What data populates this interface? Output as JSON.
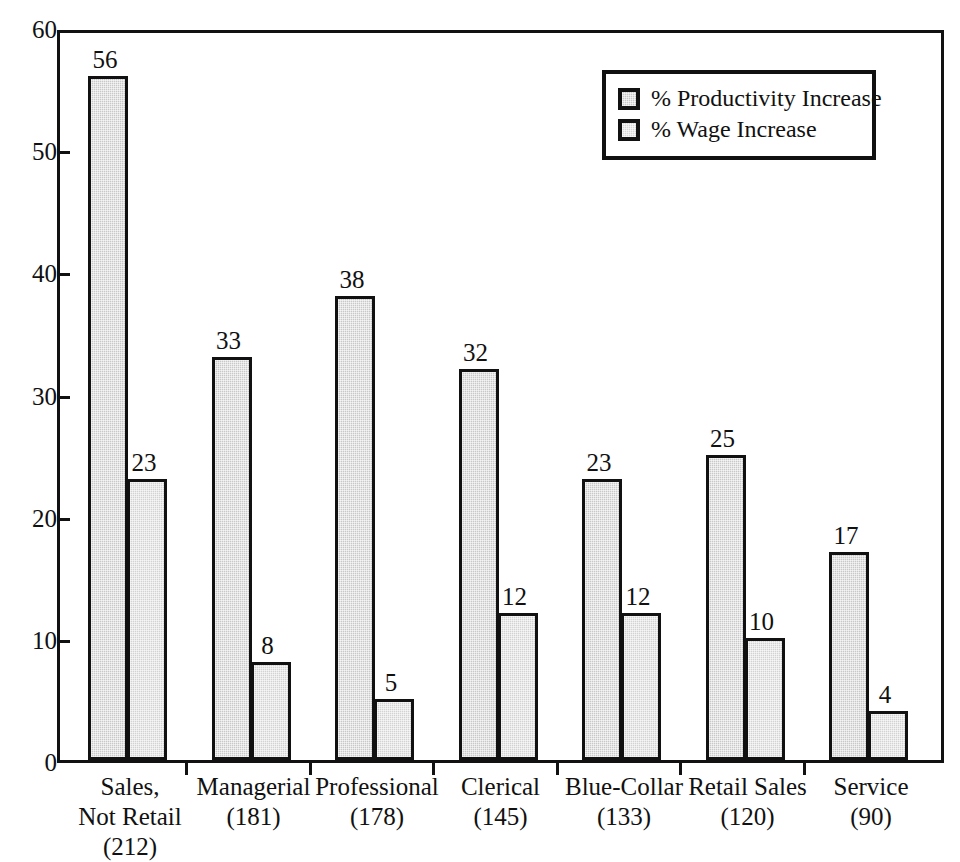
{
  "chart_data": {
    "type": "bar",
    "title": "",
    "subtitle": "",
    "xlabel": "",
    "ylabel": "",
    "ylim": [
      0,
      60
    ],
    "y_ticks": [
      0,
      10,
      20,
      30,
      40,
      50,
      60
    ],
    "y_tick_labels": [
      "0",
      "10",
      "20",
      "30",
      "40",
      "50",
      "60"
    ],
    "grid": false,
    "legend_position": "top-right",
    "categories": [
      "Sales,\nNot Retail\n(212)",
      "Managerial\n(181)",
      "Professional\n(178)",
      "Clerical\n(145)",
      "Blue-Collar\n(133)",
      "Retail Sales\n(120)",
      "Service\n(90)"
    ],
    "category_names": [
      "Sales, Not Retail",
      "Managerial",
      "Professional",
      "Clerical",
      "Blue-Collar",
      "Retail Sales",
      "Service"
    ],
    "category_counts": [
      212,
      181,
      178,
      145,
      133,
      120,
      90
    ],
    "series": [
      {
        "name": "% Productivity Increase",
        "values": [
          56,
          33,
          38,
          32,
          23,
          25,
          17
        ],
        "color": "#c8c8c8"
      },
      {
        "name": "% Wage Increase",
        "values": [
          23,
          8,
          5,
          12,
          12,
          10,
          4
        ],
        "color": "#d2d2d2"
      }
    ],
    "value_labels": [
      [
        "56",
        "23"
      ],
      [
        "33",
        "8"
      ],
      [
        "38",
        "5"
      ],
      [
        "32",
        "12"
      ],
      [
        "23",
        "12"
      ],
      [
        "25",
        "10"
      ],
      [
        "17",
        "4"
      ]
    ]
  },
  "legend": {
    "items": [
      {
        "label": "% Productivity Increase",
        "swatch": "legend-swatch-productivity"
      },
      {
        "label": "% Wage Increase",
        "swatch": "legend-swatch-wage"
      }
    ]
  },
  "colors": {
    "axis": "#111111",
    "bar_productivity": "#c8c8c8",
    "bar_wage": "#d2d2d2",
    "background": "#ffffff"
  }
}
